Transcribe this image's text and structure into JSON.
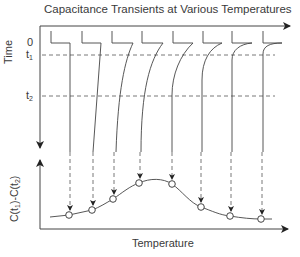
{
  "diagram": {
    "title": "Capacitance Transients at Various Temperatures",
    "top_panel": {
      "y_axis_label": "Time",
      "ticks": [
        {
          "label": "0",
          "sub": ""
        },
        {
          "label": "t",
          "sub": "1"
        },
        {
          "label": "t",
          "sub": "2"
        }
      ],
      "transient_count": 8
    },
    "bottom_panel": {
      "y_axis_label_parts": [
        "C(t",
        "1",
        ")-C(t",
        "2",
        ")"
      ],
      "x_axis_label": "Temperature",
      "points": [
        {
          "x": 69,
          "y": 215
        },
        {
          "x": 92,
          "y": 210
        },
        {
          "x": 113,
          "y": 199
        },
        {
          "x": 139,
          "y": 183
        },
        {
          "x": 172,
          "y": 184
        },
        {
          "x": 201,
          "y": 207
        },
        {
          "x": 230,
          "y": 216
        },
        {
          "x": 261,
          "y": 219
        }
      ]
    },
    "colors": {
      "line": "#444444",
      "text": "#3a3a3a",
      "background": "#ffffff"
    }
  }
}
